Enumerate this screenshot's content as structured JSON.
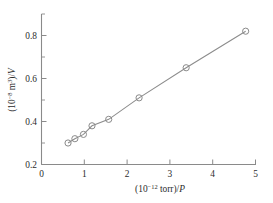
{
  "figure": {
    "background_color": "#ffffff",
    "line_color": "#8c8c8c",
    "axis_color": "#8a8a8a",
    "text_color": "#2b2b2b"
  },
  "xaxis": {
    "label_prefix": "(10",
    "label_exponent": "−12",
    "label_unit": " torr)/",
    "label_variable": "P",
    "label_full": "(10−12 torr)/P",
    "tick_labels": [
      "0",
      "1",
      "2",
      "3",
      "4",
      "5"
    ],
    "tick_values": [
      0,
      1,
      2,
      3,
      4,
      5
    ],
    "range": [
      0,
      5
    ],
    "minor_ticks_per_interval": 0
  },
  "yaxis": {
    "label_prefix": "(10",
    "label_exponent": "−8",
    "label_unit": " m",
    "label_unit_exponent": "3",
    "label_close": ")/",
    "label_variable": "V",
    "label_full": "(10−8 m3)/V",
    "tick_labels": [
      "0.2",
      "0.4",
      "0.6",
      "0.8"
    ],
    "tick_values": [
      0.2,
      0.4,
      0.6,
      0.8
    ],
    "minor_tick_values": [
      0.3,
      0.5,
      0.7,
      0.9
    ],
    "range": [
      0.2,
      0.9
    ]
  },
  "chart_data": {
    "type": "scatter",
    "title": "",
    "subtitle": "",
    "xlabel": "(10−12 torr)/P",
    "ylabel": "(10−8 m3)/V",
    "xlim": [
      0,
      5
    ],
    "ylim": [
      0.2,
      0.9
    ],
    "grid": false,
    "legend": null,
    "marker_style": "open-circle",
    "line_style": "solid",
    "annotations": [],
    "x": [
      0.62,
      0.78,
      0.98,
      1.18,
      1.57,
      2.28,
      3.38,
      4.77
    ],
    "y": [
      0.3,
      0.32,
      0.34,
      0.38,
      0.41,
      0.51,
      0.65,
      0.82
    ],
    "series": [
      {
        "name": "BET linear fit",
        "x": [
          0.62,
          0.78,
          0.98,
          1.18,
          1.57,
          2.28,
          3.38,
          4.77
        ],
        "values": [
          0.3,
          0.32,
          0.34,
          0.38,
          0.41,
          0.51,
          0.65,
          0.82
        ]
      }
    ],
    "points": [
      {
        "x": 0.62,
        "y": 0.3
      },
      {
        "x": 0.78,
        "y": 0.32
      },
      {
        "x": 0.98,
        "y": 0.34
      },
      {
        "x": 1.18,
        "y": 0.38
      },
      {
        "x": 1.57,
        "y": 0.41
      },
      {
        "x": 2.28,
        "y": 0.51
      },
      {
        "x": 3.38,
        "y": 0.65
      },
      {
        "x": 4.77,
        "y": 0.82
      }
    ]
  }
}
